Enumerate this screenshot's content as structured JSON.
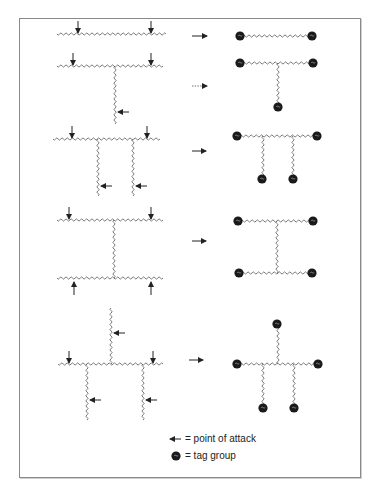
{
  "figure": {
    "colors": {
      "chain": "#555555",
      "arrow": "#222222",
      "tag": "#1a1a1a",
      "frame": "#8a8a8a"
    },
    "rows": [
      {
        "id": "linear",
        "left": {
          "chains": [
            [
              57,
              34,
              166,
              34
            ]
          ],
          "attack_arrows": [
            {
              "x": 78,
              "y": 34,
              "dir": "down"
            },
            {
              "x": 151,
              "y": 34,
              "dir": "down"
            }
          ]
        },
        "reaction_arrow": {
          "x1": 192,
          "x2": 207,
          "y": 36,
          "style": "solid"
        },
        "right": {
          "chains": [
            [
              240,
              36,
              312,
              36
            ]
          ],
          "tags": [
            [
              240,
              36
            ],
            [
              312,
              36
            ]
          ]
        }
      },
      {
        "id": "t-branch",
        "left": {
          "chains": [
            [
              57,
              66,
              163,
              66
            ],
            [
              115,
              66,
              115,
              124
            ]
          ],
          "attack_arrows": [
            {
              "x": 73,
              "y": 66,
              "dir": "down"
            },
            {
              "x": 151,
              "y": 66,
              "dir": "down"
            },
            {
              "x": 117,
              "y": 112,
              "dir": "left"
            }
          ]
        },
        "reaction_arrow": {
          "x1": 192,
          "x2": 207,
          "y": 86,
          "style": "dotted"
        },
        "right": {
          "chains": [
            [
              240,
              63,
              313,
              63
            ],
            [
              278,
              63,
              278,
              107
            ]
          ],
          "tags": [
            [
              240,
              63
            ],
            [
              313,
              63
            ],
            [
              278,
              107
            ]
          ]
        }
      },
      {
        "id": "comb",
        "left": {
          "chains": [
            [
              53,
              139,
              160,
              139
            ],
            [
              98,
              139,
              98,
              196
            ],
            [
              133,
              139,
              133,
              196
            ]
          ],
          "attack_arrows": [
            {
              "x": 72,
              "y": 139,
              "dir": "down"
            },
            {
              "x": 147,
              "y": 139,
              "dir": "down"
            },
            {
              "x": 100,
              "y": 186,
              "dir": "left"
            },
            {
              "x": 135,
              "y": 186,
              "dir": "left"
            }
          ]
        },
        "reaction_arrow": {
          "x1": 192,
          "x2": 206,
          "y": 151,
          "style": "solid"
        },
        "right": {
          "chains": [
            [
              237,
              136,
              317,
              136
            ],
            [
              263,
              136,
              263,
              179
            ],
            [
              293,
              136,
              293,
              179
            ]
          ],
          "tags": [
            [
              237,
              136
            ],
            [
              317,
              136
            ],
            [
              262,
              179
            ],
            [
              293,
              179
            ]
          ]
        }
      },
      {
        "id": "h-shape",
        "left": {
          "chains": [
            [
              57,
              220,
              163,
              220
            ],
            [
              114,
              220,
              114,
              278
            ],
            [
              57,
              278,
              163,
              278
            ]
          ],
          "attack_arrows": [
            {
              "x": 69,
              "y": 220,
              "dir": "down"
            },
            {
              "x": 151,
              "y": 220,
              "dir": "down"
            },
            {
              "x": 74,
              "y": 278,
              "dir": "up"
            },
            {
              "x": 151,
              "y": 278,
              "dir": "up"
            }
          ]
        },
        "reaction_arrow": {
          "x1": 192,
          "x2": 206,
          "y": 241,
          "style": "solid"
        },
        "right": {
          "chains": [
            [
              238,
              221,
              313,
              221
            ],
            [
              277,
              221,
              277,
              273
            ],
            [
              239,
              273,
              312,
              273
            ]
          ],
          "tags": [
            [
              238,
              221
            ],
            [
              313,
              221
            ],
            [
              239,
              273
            ],
            [
              312,
              273
            ]
          ]
        }
      },
      {
        "id": "star-comb",
        "left": {
          "chains": [
            [
              58,
              364,
              163,
              364
            ],
            [
              111,
              308,
              111,
              364
            ],
            [
              87,
              364,
              87,
              420
            ],
            [
              143,
              364,
              143,
              420
            ]
          ],
          "attack_arrows": [
            {
              "x": 69,
              "y": 364,
              "dir": "down"
            },
            {
              "x": 153,
              "y": 364,
              "dir": "down"
            },
            {
              "x": 113,
              "y": 333,
              "dir": "left"
            },
            {
              "x": 89,
              "y": 400,
              "dir": "left"
            },
            {
              "x": 145,
              "y": 400,
              "dir": "left"
            }
          ]
        },
        "reaction_arrow": {
          "x1": 189,
          "x2": 203,
          "y": 360,
          "style": "solid"
        },
        "right": {
          "chains": [
            [
              237,
              364,
              318,
              364
            ],
            [
              278,
              324,
              278,
              364
            ],
            [
              263,
              364,
              263,
              408
            ],
            [
              294,
              364,
              294,
              408
            ]
          ],
          "tags": [
            [
              277,
              324
            ],
            [
              237,
              364
            ],
            [
              318,
              364
            ],
            [
              263,
              408
            ],
            [
              294,
              408
            ]
          ]
        }
      }
    ]
  },
  "legend": {
    "attack_label": "= point of attack",
    "tag_label": "= tag group"
  }
}
